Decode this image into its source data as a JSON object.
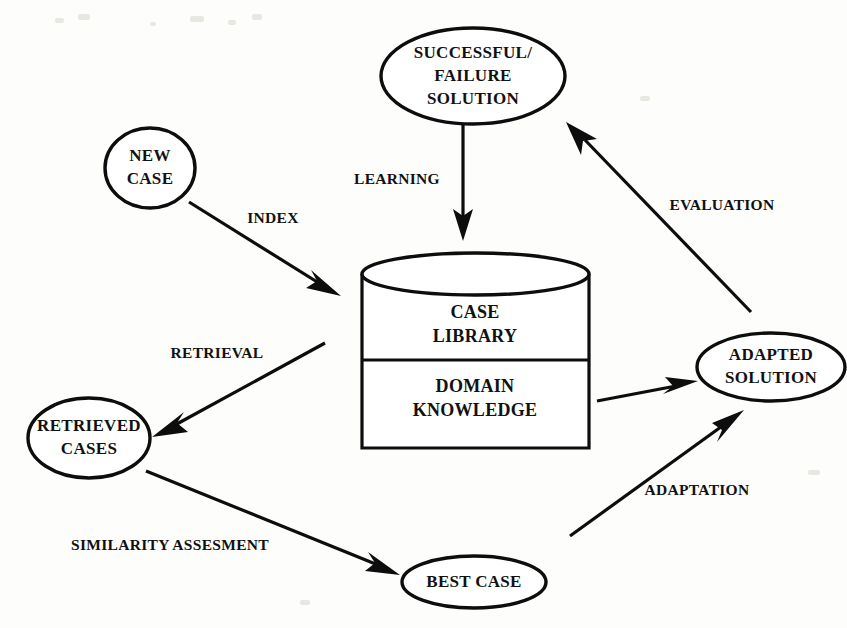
{
  "diagram": {
    "background_color": "#fdfdfc",
    "stroke_color": "#0d0d0d",
    "nodes": {
      "successful_failure_solution": {
        "lines": [
          "SUCCESSFUL/",
          "FAILURE",
          "SOLUTION"
        ],
        "shape": "ellipse",
        "cx": 473,
        "cy": 76,
        "rx": 92,
        "ry": 48
      },
      "new_case": {
        "lines": [
          "NEW",
          "CASE"
        ],
        "shape": "ellipse",
        "cx": 150,
        "cy": 168,
        "rx": 45,
        "ry": 40
      },
      "retrieved_cases": {
        "lines": [
          "RETRIEVED",
          "CASES"
        ],
        "shape": "ellipse",
        "cx": 89,
        "cy": 438,
        "rx": 61,
        "ry": 40
      },
      "best_case": {
        "lines": [
          "BEST CASE"
        ],
        "shape": "ellipse",
        "cx": 474,
        "cy": 582,
        "rx": 72,
        "ry": 26
      },
      "adapted_solution": {
        "lines": [
          "ADAPTED",
          "SOLUTION"
        ],
        "shape": "ellipse",
        "cx": 771,
        "cy": 367,
        "rx": 74,
        "ry": 34
      },
      "case_library_store": {
        "shape": "cylinder",
        "upper_lines": [
          "CASE",
          "LIBRARY"
        ],
        "lower_lines": [
          "DOMAIN",
          "KNOWLEDGE"
        ],
        "left": 362,
        "right": 589,
        "top": 253,
        "bottom": 448,
        "divider": 360,
        "ellipse_ry": 21
      }
    },
    "edges": [
      {
        "name": "index",
        "label": "INDEX",
        "from": "new_case",
        "to": "case_library_store",
        "label_x": 273,
        "label_y": 219
      },
      {
        "name": "learning",
        "label": "LEARNING",
        "from": "successful_failure_solution",
        "to": "case_library_store",
        "label_x": 397,
        "label_y": 180
      },
      {
        "name": "retrieval",
        "label": "RETRIEVAL",
        "from": "case_library_store",
        "to": "retrieved_cases",
        "label_x": 217,
        "label_y": 354
      },
      {
        "name": "similarity-assesment",
        "label": "SIMILARITY ASSESMENT",
        "from": "retrieved_cases",
        "to": "best_case",
        "label_x": 170,
        "label_y": 546
      },
      {
        "name": "adaptation",
        "label": "ADAPTATION",
        "from": "best_case",
        "to": "adapted_solution",
        "label_x": 697,
        "label_y": 491
      },
      {
        "name": "domain-knowledge-feed",
        "label": "",
        "from": "case_library_store",
        "to": "adapted_solution",
        "label_x": 0,
        "label_y": 0
      },
      {
        "name": "evaluation",
        "label": "EVALUATION",
        "from": "adapted_solution",
        "to": "successful_failure_solution",
        "label_x": 722,
        "label_y": 206
      }
    ]
  }
}
